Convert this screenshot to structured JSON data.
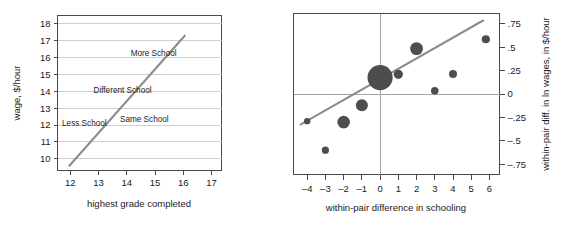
{
  "figure": {
    "panel_count": 2
  },
  "chart_data": [
    {
      "id": "left-panel",
      "type": "line",
      "title": "",
      "xlabel": "highest grade completed",
      "ylabel": "wage, $/hour",
      "xlim": [
        11.55,
        17.35
      ],
      "ylim": [
        9.3,
        18.5
      ],
      "xticks": [
        12,
        13,
        14,
        15,
        16,
        17
      ],
      "xtick_labels": [
        "12",
        "13",
        "14",
        "15",
        "16",
        "17"
      ],
      "yticks": [
        10,
        11,
        12,
        13,
        14,
        15,
        16,
        17,
        18
      ],
      "ytick_labels": [
        "10",
        "11",
        "12",
        "13",
        "14",
        "15",
        "16",
        "17",
        "18"
      ],
      "grid": "horizontal",
      "legend": "none",
      "series": [
        {
          "name": "wage-schooling regression line",
          "type": "line",
          "x": [
            11.97,
            16.05
          ],
          "y": [
            9.58,
            17.3
          ]
        }
      ],
      "annotations": [
        {
          "text": "More School",
          "x": 14.95,
          "y": 16.25
        },
        {
          "text": "Different School",
          "x": 13.85,
          "y": 14.05
        },
        {
          "text": "Less School",
          "x": 12.5,
          "y": 12.1
        },
        {
          "text": "Same School",
          "x": 14.62,
          "y": 12.35
        }
      ]
    },
    {
      "id": "right-panel",
      "type": "scatter",
      "title": "",
      "xlabel": "within-pair difference in schooling",
      "ylabel": "within-pair diff. in ln wages, in $/hour",
      "ylabel_side": "right",
      "xlim": [
        -4.75,
        6.55
      ],
      "ylim": [
        -0.86,
        0.86
      ],
      "xticks": [
        -4,
        -3,
        -2,
        -1,
        0,
        1,
        2,
        3,
        4,
        5,
        6
      ],
      "xtick_labels": [
        "–4",
        "–3",
        "–2",
        "–1",
        "0",
        "1",
        "2",
        "3",
        "4",
        "5",
        "6"
      ],
      "yticks": [
        0.75,
        0.5,
        0.25,
        0,
        -0.25,
        -0.5,
        -0.75
      ],
      "ytick_labels": [
        ".75",
        ".5",
        ".25",
        "0",
        "–.25",
        "–.5",
        "–.75"
      ],
      "grid": "zero-lines",
      "legend": "none",
      "points": [
        {
          "x": -4,
          "y": -0.29,
          "size": 3.2
        },
        {
          "x": -3,
          "y": -0.6,
          "size": 3.6
        },
        {
          "x": -2,
          "y": -0.3,
          "size": 6.3
        },
        {
          "x": -1,
          "y": -0.12,
          "size": 6.0
        },
        {
          "x": 0,
          "y": 0.175,
          "size": 12.6
        },
        {
          "x": 1,
          "y": 0.21,
          "size": 4.6
        },
        {
          "x": 2,
          "y": 0.485,
          "size": 6.4
        },
        {
          "x": 3,
          "y": 0.035,
          "size": 3.8
        },
        {
          "x": 4,
          "y": 0.215,
          "size": 4.0
        },
        {
          "x": 5.8,
          "y": 0.585,
          "size": 4.1
        }
      ],
      "series": [
        {
          "name": "within-pair regression line",
          "type": "line",
          "x": [
            -4.35,
            5.65
          ],
          "y": [
            -0.325,
            0.785
          ]
        }
      ]
    }
  ],
  "colors": {
    "dot": "#4d4d4d",
    "fit_line": "#8d8d8d",
    "grid": "#c9c9c9",
    "axis": "#4a4a4a",
    "text": "#1a1a1a",
    "background": "#ffffff"
  }
}
